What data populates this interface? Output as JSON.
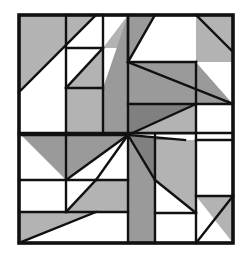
{
  "image": {
    "kind": "quilt-block-diagram",
    "title": "Pinwheel Quilt Block Pattern",
    "width": 248,
    "height": 257,
    "background_color": "#ffffff"
  },
  "palette": {
    "background": "#ffffff",
    "patch_white": "#ffffff",
    "patch_light_gray": "#b3b3b3",
    "patch_mid_gray": "#9a9a9a",
    "patch_dark_gray": "#808080",
    "outline": "#111111",
    "border": "#111111"
  },
  "block": {
    "bounds": {
      "x": 19,
      "y": 15,
      "width": 214,
      "height": 228
    },
    "center": {
      "x": 128,
      "y": 135
    },
    "border_width": 3.5,
    "seam_width": 2.4
  },
  "patches": [
    {
      "name": "top-left-corner-triangle",
      "fill": "light",
      "points": "19,15 96,15 19,92"
    },
    {
      "name": "top-left-wedge-white",
      "fill": "white",
      "points": "96,15 19,92 19,133 66,133 66,48"
    },
    {
      "name": "top-left-inner-white-square",
      "fill": "white",
      "points": "66,48 103,48 103,15 96,15"
    },
    {
      "name": "top-left-notch-white",
      "fill": "white",
      "points": "66,48 103,48 103,88 66,88"
    },
    {
      "name": "top-left-small-triangle-light",
      "fill": "light",
      "points": "66,88 103,88 103,48"
    },
    {
      "name": "top-left-inner-light-strip",
      "fill": "light",
      "points": "66,88 103,88 103,133 66,133"
    },
    {
      "name": "top-mid-white-square",
      "fill": "white",
      "points": "103,15 128,15 128,48 103,48"
    },
    {
      "name": "top-mid-triangle-light",
      "fill": "light",
      "points": "103,48 128,48 128,15"
    },
    {
      "name": "top-center-mid-wedge",
      "fill": "mid",
      "points": "128,15 155,15 128,135 103,133 103,88"
    },
    {
      "name": "top-center-upper-white",
      "fill": "white",
      "points": "155,15 196,15 196,62 128,62"
    },
    {
      "name": "top-right-corner-triangle",
      "fill": "light",
      "points": "196,15 233,15 233,62 196,62"
    },
    {
      "name": "top-right-upper-light",
      "fill": "light",
      "points": "196,15 233,15 233,52"
    },
    {
      "name": "right-upper-mid-band",
      "fill": "mid",
      "points": "128,62 196,62 233,104 128,104"
    },
    {
      "name": "right-upper-white-square",
      "fill": "white",
      "points": "196,62 233,62 233,104"
    },
    {
      "name": "right-arm-dark",
      "fill": "dark",
      "points": "128,104 196,104 128,135"
    },
    {
      "name": "right-mid-light",
      "fill": "light",
      "points": "196,104 233,104 233,135 128,135"
    },
    {
      "name": "right-lower-white",
      "fill": "white",
      "points": "196,104 233,104 233,140 196,140"
    },
    {
      "name": "left-upper-mid-arm",
      "fill": "mid",
      "points": "19,133 66,133 128,135 66,180 19,180"
    },
    {
      "name": "left-upper-white-triangle",
      "fill": "white",
      "points": "19,133 19,180 66,180"
    },
    {
      "name": "left-mid-white-square",
      "fill": "white",
      "points": "19,180 66,180 66,212 19,212"
    },
    {
      "name": "left-center-white-triangle",
      "fill": "white",
      "points": "66,180 128,135 128,212 66,212"
    },
    {
      "name": "center-left-light-band",
      "fill": "light",
      "points": "66,212 128,212 128,180 96,180"
    },
    {
      "name": "bottom-left-corner-light",
      "fill": "light",
      "points": "19,212 96,212 19,243"
    },
    {
      "name": "bottom-left-white-triangle",
      "fill": "white",
      "points": "96,212 19,243 128,243 128,212"
    },
    {
      "name": "bottom-center-mid-wedge",
      "fill": "mid",
      "points": "128,135 155,180 155,243 128,243"
    },
    {
      "name": "bottom-center-dark-wedge",
      "fill": "dark",
      "points": "128,135 185,140 155,180"
    },
    {
      "name": "bottom-right-light-panel",
      "fill": "light",
      "points": "155,140 196,140 196,213 155,213"
    },
    {
      "name": "bottom-right-white-triangle",
      "fill": "white",
      "points": "155,180 196,213 155,213"
    },
    {
      "name": "bottom-right-white-square",
      "fill": "white",
      "points": "155,213 196,213 196,243 155,243"
    },
    {
      "name": "right-edge-white-strip",
      "fill": "white",
      "points": "196,140 233,140 233,196 196,196"
    },
    {
      "name": "bottom-right-corner-light",
      "fill": "light",
      "points": "196,196 233,196 233,243 196,243"
    },
    {
      "name": "bottom-right-corner-white-triangle",
      "fill": "white",
      "points": "196,196 233,243 196,243"
    }
  ],
  "seams": [
    "19,15 233,15 233,243 19,243 19,15",
    "19,92 96,15",
    "66,15 66,133",
    "103,15 103,133",
    "66,48 103,48",
    "66,88 103,88",
    "103,48 66,88",
    "128,15 128,62",
    "155,15 128,62",
    "19,133 233,133",
    "19,135 128,135",
    "128,62 196,62",
    "128,62 233,104",
    "196,62 196,104",
    "128,104 233,104",
    "196,104 196,243",
    "233,52 196,15",
    "233,140 196,140",
    "155,135 155,243",
    "128,15 128,243",
    "128,135 196,104",
    "128,135 185,140",
    "128,135 155,180",
    "128,135 66,180",
    "128,135 96,180",
    "19,180 128,180",
    "19,212 128,212",
    "66,133 66,212",
    "96,212 19,243",
    "96,180 66,212",
    "155,180 196,213",
    "155,213 196,213",
    "233,196 196,243",
    "196,196 233,196"
  ]
}
